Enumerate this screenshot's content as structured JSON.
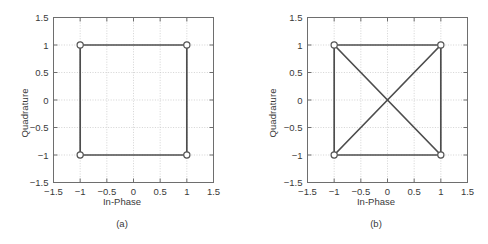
{
  "figure": {
    "panels": [
      {
        "id": "a",
        "caption": "(a)",
        "xlabel": "In-Phase",
        "ylabel": "Quadrature"
      },
      {
        "id": "b",
        "caption": "(b)",
        "xlabel": "In-Phase",
        "ylabel": "Quadrature"
      }
    ]
  },
  "chart_data": [
    {
      "type": "scatter",
      "panel": "a",
      "title": "",
      "xlabel": "In-Phase",
      "ylabel": "Quadrature",
      "xlim": [
        -1.5,
        1.5
      ],
      "ylim": [
        -1.5,
        1.5
      ],
      "xticks": [
        -1.5,
        -1,
        -0.5,
        0,
        0.5,
        1,
        1.5
      ],
      "xticklabels": [
        "−1.5",
        "−1",
        "−0.5",
        "0",
        "0.5",
        "1",
        "1.5"
      ],
      "yticks": [
        -1.5,
        -1,
        -0.5,
        0,
        0.5,
        1,
        1.5
      ],
      "yticklabels": [
        "−1.5",
        "−1",
        "−0.5",
        "0",
        "0.5",
        "1",
        "1.5"
      ],
      "grid": true,
      "legend": null,
      "points": [
        {
          "x": -1,
          "y": 1
        },
        {
          "x": 1,
          "y": 1
        },
        {
          "x": 1,
          "y": -1
        },
        {
          "x": -1,
          "y": -1
        }
      ],
      "edges": [
        {
          "from": [
            -1,
            1
          ],
          "to": [
            1,
            1
          ]
        },
        {
          "from": [
            1,
            1
          ],
          "to": [
            1,
            -1
          ]
        },
        {
          "from": [
            1,
            -1
          ],
          "to": [
            -1,
            -1
          ]
        },
        {
          "from": [
            -1,
            -1
          ],
          "to": [
            -1,
            1
          ]
        }
      ],
      "marker": "open-circle",
      "line_color": "#4d4d4d",
      "grid_color": "#c8c8c8",
      "axis_color": "#6e6e6e"
    },
    {
      "type": "scatter",
      "panel": "b",
      "title": "",
      "xlabel": "In-Phase",
      "ylabel": "Quadrature",
      "xlim": [
        -1.5,
        1.5
      ],
      "ylim": [
        -1.5,
        1.5
      ],
      "xticks": [
        -1.5,
        -1,
        -0.5,
        0,
        0.5,
        1,
        1.5
      ],
      "xticklabels": [
        "−1.5",
        "−1",
        "−0.5",
        "0",
        "0.5",
        "1",
        "1.5"
      ],
      "yticks": [
        -1.5,
        -1,
        -0.5,
        0,
        0.5,
        1,
        1.5
      ],
      "yticklabels": [
        "−1.5",
        "−1",
        "−0.5",
        "0",
        "0.5",
        "1",
        "1.5"
      ],
      "grid": true,
      "legend": null,
      "points": [
        {
          "x": -1,
          "y": 1
        },
        {
          "x": 1,
          "y": 1
        },
        {
          "x": 1,
          "y": -1
        },
        {
          "x": -1,
          "y": -1
        }
      ],
      "edges": [
        {
          "from": [
            -1,
            1
          ],
          "to": [
            1,
            1
          ]
        },
        {
          "from": [
            1,
            1
          ],
          "to": [
            1,
            -1
          ]
        },
        {
          "from": [
            1,
            -1
          ],
          "to": [
            -1,
            -1
          ]
        },
        {
          "from": [
            -1,
            -1
          ],
          "to": [
            -1,
            1
          ]
        },
        {
          "from": [
            -1,
            1
          ],
          "to": [
            1,
            -1
          ]
        },
        {
          "from": [
            -1,
            -1
          ],
          "to": [
            1,
            1
          ]
        }
      ],
      "marker": "open-circle",
      "line_color": "#4d4d4d",
      "grid_color": "#c8c8c8",
      "axis_color": "#6e6e6e"
    }
  ]
}
